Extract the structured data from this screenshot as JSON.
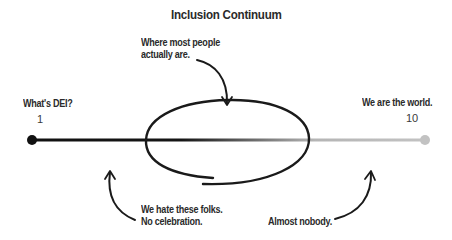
{
  "title": "Inclusion Continuum",
  "scale": {
    "min_label": "1",
    "max_label": "10",
    "left_caption": "What's DEI?",
    "right_caption": "We are the world."
  },
  "annotations": {
    "top": {
      "line1": "Where most people",
      "line2": "actually are."
    },
    "bottom_left": {
      "line1": "We hate these folks.",
      "line2": "No celebration."
    },
    "bottom_right": {
      "line1": "Almost nobody."
    }
  },
  "colors": {
    "line_start": "#111111",
    "line_end": "#bdbdbd",
    "ink": "#1a1a1a",
    "text": "#2a2a2a"
  }
}
